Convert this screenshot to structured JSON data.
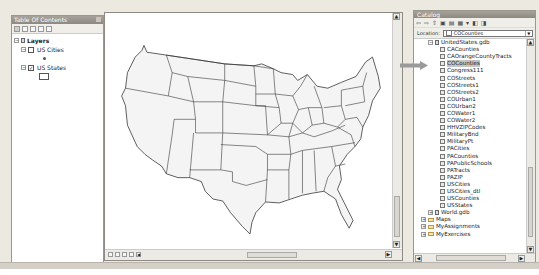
{
  "toc": {
    "title": "Table Of Contents",
    "toolbar_icons": [
      "list-by-drawing-order-icon",
      "list-by-source-icon",
      "list-by-visibility-icon",
      "list-by-selection-icon",
      "options-icon"
    ],
    "root": {
      "label": "Layers",
      "expanded": true
    },
    "layers": [
      {
        "label": "US Cities",
        "checked": false,
        "expanded": true,
        "symbol": "point"
      },
      {
        "label": "US States",
        "checked": true,
        "expanded": true,
        "symbol": "polygon"
      }
    ]
  },
  "map": {
    "content": "Contiguous United States state boundaries",
    "view_buttons": [
      "data-view-icon",
      "layout-view-icon",
      "refresh-icon",
      "pause-drawing-icon"
    ]
  },
  "catalog": {
    "title": "Catalog",
    "toolbar_icons": [
      "back-icon",
      "forward-icon",
      "up-one-level-icon",
      "connect-folder-icon",
      "disconnect-folder-icon",
      "toggle-contents-icon",
      "view-options-icon",
      "launch-arccatalog-icon",
      "search-window-icon"
    ],
    "location_label": "Location:",
    "location_value": "COCounties",
    "tree": [
      {
        "label": "UnitedStates.gdb",
        "type": "gdb",
        "indent": 2,
        "expander": "−"
      },
      {
        "label": "CACounties",
        "type": "fc",
        "indent": 3
      },
      {
        "label": "CAOrangeCountyTracts",
        "type": "fc",
        "indent": 3
      },
      {
        "label": "COCounties",
        "type": "fc",
        "indent": 3,
        "selected": true
      },
      {
        "label": "Congress111",
        "type": "fc",
        "indent": 3
      },
      {
        "label": "COStreets",
        "type": "fc",
        "indent": 3
      },
      {
        "label": "COStreets1",
        "type": "fc",
        "indent": 3
      },
      {
        "label": "COStreets2",
        "type": "fc",
        "indent": 3
      },
      {
        "label": "COUrban1",
        "type": "fc",
        "indent": 3
      },
      {
        "label": "COUrban2",
        "type": "fc",
        "indent": 3
      },
      {
        "label": "COWater1",
        "type": "fc",
        "indent": 3
      },
      {
        "label": "COWater2",
        "type": "fc",
        "indent": 3
      },
      {
        "label": "HHVZIPCodes",
        "type": "fc",
        "indent": 3
      },
      {
        "label": "MilitaryBnd",
        "type": "fc",
        "indent": 3
      },
      {
        "label": "MilitaryPt",
        "type": "fc",
        "indent": 3
      },
      {
        "label": "PACities",
        "type": "fc",
        "indent": 3
      },
      {
        "label": "PACounties",
        "type": "fc",
        "indent": 3
      },
      {
        "label": "PAPublicSchools",
        "type": "fc",
        "indent": 3
      },
      {
        "label": "PATracts",
        "type": "fc",
        "indent": 3
      },
      {
        "label": "PAZIP",
        "type": "fc",
        "indent": 3
      },
      {
        "label": "USCities",
        "type": "fc",
        "indent": 3
      },
      {
        "label": "USCities_dtl",
        "type": "fc",
        "indent": 3
      },
      {
        "label": "USCounties",
        "type": "fc",
        "indent": 3
      },
      {
        "label": "USStates",
        "type": "fc",
        "indent": 3
      },
      {
        "label": "World.gdb",
        "type": "gdb",
        "indent": 2,
        "expander": "+"
      },
      {
        "label": "Maps",
        "type": "folder",
        "indent": 1,
        "expander": "+"
      },
      {
        "label": "MyAssignments",
        "type": "folder",
        "indent": 1,
        "expander": "+"
      },
      {
        "label": "MyExercises",
        "type": "folder",
        "indent": 1,
        "expander": "+"
      }
    ]
  },
  "annotation": {
    "arrow_target": "COCounties",
    "color": "#9a9a9a"
  }
}
